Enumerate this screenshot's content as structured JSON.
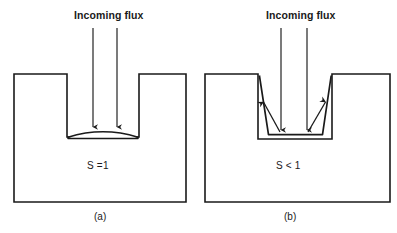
{
  "figure": {
    "background_color": "#ffffff",
    "line_color": "#1a1a1a",
    "panels": [
      {
        "id": "a",
        "caption": "(a)",
        "flux_label": "Incoming flux",
        "sticking_label": "S =1",
        "description": "Unity sticking coefficient: deposit accumulates only at the trench bottom as a lens-shaped mound; trench sidewalls remain bare.",
        "substrate": {
          "left": 14,
          "right": 186,
          "top": 74,
          "bottom": 202,
          "trench_left": 67,
          "trench_right": 139,
          "trench_bottom": 137
        },
        "flux_arrows": [
          {
            "x": 93,
            "y_start": 28,
            "y_end": 128
          },
          {
            "x": 117,
            "y_start": 28,
            "y_end": 128
          }
        ],
        "film": {
          "type": "lens-mound",
          "left": 68,
          "right": 138,
          "base_y": 137,
          "apex_y": 129
        }
      },
      {
        "id": "b",
        "caption": "(b)",
        "flux_label": "Incoming flux",
        "sticking_label": "S < 1",
        "description": "Sticking coefficient below unity: flux re-emits from the trench floor onto the sidewalls, producing a conformal tapered liner.",
        "substrate": {
          "left": 205,
          "right": 390,
          "top": 74,
          "bottom": 202,
          "trench_left": 258,
          "trench_right": 332,
          "trench_bottom": 139
        },
        "flux_arrows": [
          {
            "x": 281,
            "y_start": 28,
            "y_end": 131
          },
          {
            "x": 307,
            "y_start": 28,
            "y_end": 131
          }
        ],
        "reemission_arrows": [
          {
            "from_x": 279,
            "from_y": 131,
            "to_x": 263,
            "to_y": 101
          },
          {
            "from_x": 309,
            "from_y": 131,
            "to_x": 326,
            "to_y": 101
          }
        ],
        "film": {
          "type": "conformal-liner",
          "top_left": 262,
          "top_right": 328,
          "bottom_left": 268,
          "bottom_right": 323,
          "top_y": 76,
          "bottom_y": 134,
          "floor_y": 139
        }
      }
    ]
  }
}
